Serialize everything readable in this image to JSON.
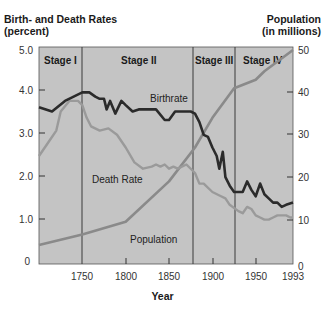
{
  "chart_data": {
    "type": "line",
    "title": "",
    "xlabel": "Year",
    "ylabel_left": "Birth- and Death Rates\n(percent)",
    "ylabel_left_lines": [
      "Birth- and Death Rates",
      "(percent)"
    ],
    "ylabel_right_lines": [
      "Population",
      "(in millions)"
    ],
    "ylim_left": [
      0,
      5.0
    ],
    "ylim_right": [
      0,
      50
    ],
    "xlim": [
      1700,
      1993
    ],
    "x_ticks": [
      "1750",
      "1800",
      "1850",
      "1900",
      "1950",
      "1993"
    ],
    "y_ticks_left": [
      "0",
      "1.0",
      "2.0",
      "3.0",
      "4.0",
      "5.0"
    ],
    "y_ticks_right": [
      "0",
      "10",
      "20",
      "30",
      "40",
      "50"
    ],
    "grid": false,
    "legend": "inline labels",
    "stages": [
      {
        "label": "Stage I",
        "start": 1700,
        "end": 1750
      },
      {
        "label": "Stage II",
        "start": 1750,
        "end": 1880
      },
      {
        "label": "Stage III",
        "start": 1880,
        "end": 1928
      },
      {
        "label": "Stage IV",
        "start": 1928,
        "end": 1993
      }
    ],
    "series": [
      {
        "name": "Birthrate",
        "axis": "left",
        "color": "#2b2b2b",
        "x": [
          1700,
          1715,
          1730,
          1750,
          1758,
          1765,
          1770,
          1775,
          1778,
          1782,
          1788,
          1795,
          1800,
          1808,
          1815,
          1825,
          1835,
          1845,
          1850,
          1857,
          1865,
          1875,
          1880,
          1885,
          1890,
          1895,
          1900,
          1905,
          1908,
          1912,
          1915,
          1920,
          1925,
          1930,
          1935,
          1940,
          1945,
          1950,
          1955,
          1960,
          1965,
          1970,
          1975,
          1980,
          1985,
          1993
        ],
        "values": [
          3.65,
          3.55,
          3.8,
          4.0,
          4.0,
          3.9,
          3.85,
          3.85,
          3.6,
          3.8,
          3.5,
          3.8,
          3.7,
          3.55,
          3.6,
          3.6,
          3.6,
          3.35,
          3.35,
          3.55,
          3.55,
          3.55,
          3.5,
          3.3,
          3.0,
          2.95,
          2.7,
          2.5,
          2.2,
          2.6,
          2.0,
          1.8,
          1.65,
          1.65,
          1.65,
          1.9,
          1.7,
          1.55,
          1.85,
          1.6,
          1.5,
          1.4,
          1.4,
          1.3,
          1.35,
          1.4
        ]
      },
      {
        "name": "Death Rate",
        "axis": "left",
        "color": "#9a9a9a",
        "x": [
          1700,
          1710,
          1720,
          1725,
          1735,
          1745,
          1750,
          1755,
          1760,
          1770,
          1780,
          1790,
          1800,
          1810,
          1820,
          1830,
          1835,
          1840,
          1845,
          1850,
          1855,
          1860,
          1870,
          1880,
          1885,
          1890,
          1900,
          1910,
          1915,
          1920,
          1930,
          1935,
          1940,
          1945,
          1950,
          1955,
          1960,
          1965,
          1970,
          1975,
          1980,
          1985,
          1990,
          1993
        ],
        "values": [
          2.5,
          2.8,
          3.1,
          3.55,
          3.8,
          3.8,
          3.7,
          3.4,
          3.2,
          3.1,
          3.15,
          3.0,
          2.7,
          2.35,
          2.2,
          2.25,
          2.3,
          2.25,
          2.3,
          2.2,
          2.25,
          2.2,
          2.3,
          2.1,
          1.85,
          1.85,
          1.65,
          1.55,
          1.5,
          1.35,
          1.2,
          1.15,
          1.3,
          1.25,
          1.1,
          1.05,
          1.0,
          1.0,
          1.05,
          1.1,
          1.1,
          1.1,
          1.05,
          1.05
        ]
      },
      {
        "name": "Population",
        "axis": "right",
        "color": "#8a8a8a",
        "x": [
          1700,
          1750,
          1800,
          1850,
          1880,
          1900,
          1925,
          1950,
          1960,
          1993
        ],
        "values": [
          4.0,
          6.5,
          9.5,
          19.0,
          27.0,
          34.0,
          41.0,
          43.0,
          45.0,
          50.0
        ]
      }
    ],
    "annotations": [
      {
        "text": "Birthrate"
      },
      {
        "text": "Death Rate"
      },
      {
        "text": "Population"
      }
    ]
  },
  "labels": {
    "left_axis_line1": "Birth- and Death Rates",
    "left_axis_line2": "(percent)",
    "right_axis_line1": "Population",
    "right_axis_line2": "(in millions)",
    "x_axis": "Year",
    "birthrate": "Birthrate",
    "death_rate": "Death Rate",
    "population": "Population",
    "stage1": "Stage I",
    "stage2": "Stage II",
    "stage3": "Stage III",
    "stage4": "Stage IV"
  },
  "ticks": {
    "left": [
      "0",
      "1.0",
      "2.0",
      "3.0",
      "4.0",
      "5.0"
    ],
    "right": [
      "0",
      "10",
      "20",
      "30",
      "40",
      "50"
    ],
    "x": [
      "1750",
      "1800",
      "1850",
      "1900",
      "1950",
      "1993"
    ]
  },
  "colors": {
    "plot_bg": "#c4c4c4",
    "birthrate": "#2b2b2b",
    "death_rate": "#9a9a9a",
    "population": "#8a8a8a",
    "divider": "#3a3a3a"
  }
}
